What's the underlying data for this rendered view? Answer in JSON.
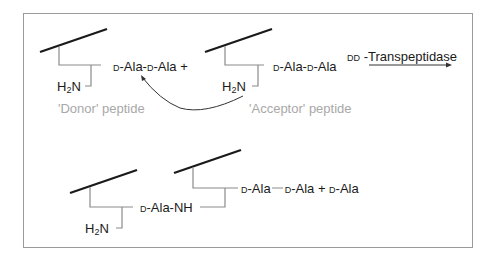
{
  "diagram": {
    "top_row": {
      "donor": {
        "d_prefix_1": "D",
        "chain": "-Ala-",
        "d_prefix_2": "D",
        "chain_end": "-Ala",
        "plus": "+",
        "amine": "H",
        "amine_sub": "2",
        "amine_n": "N",
        "label": "'Donor' peptide"
      },
      "acceptor": {
        "d_prefix_1": "D",
        "chain": "-Ala-",
        "d_prefix_2": "D",
        "chain_end": "-Ala",
        "amine": "H",
        "amine_sub": "2",
        "amine_n": "N",
        "label": "'Acceptor' peptide"
      },
      "enzyme": {
        "prefix": "DD",
        "name": "-Transpeptidase"
      }
    },
    "bottom_row": {
      "amine": "H",
      "amine_sub": "2",
      "amine_n": "N",
      "link_prefix": "D",
      "link": "-Ala-NH",
      "product_prefix_1": "D",
      "product_1": "-Ala",
      "product_prefix_2": "D",
      "product_2": "-Ala",
      "plus": "+",
      "release_prefix": "D",
      "release": "-Ala"
    },
    "colors": {
      "stroke": "#1a1a1a",
      "stem": "#8a8a8a",
      "label_grey": "#a8a8a8",
      "frame": "#9a9a9a"
    }
  }
}
